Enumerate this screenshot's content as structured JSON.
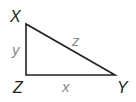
{
  "diagram": {
    "type": "right-triangle",
    "vertices": [
      {
        "label": "X",
        "x": 26,
        "y": 24
      },
      {
        "label": "Z",
        "x": 26,
        "y": 75
      },
      {
        "label": "Y",
        "x": 115,
        "y": 75
      }
    ],
    "sides": [
      {
        "label": "y",
        "between": "X-Z"
      },
      {
        "label": "x",
        "between": "Z-Y"
      },
      {
        "label": "z",
        "between": "X-Y"
      }
    ],
    "colors": {
      "stroke": "#222222",
      "vertex_label": "#222222",
      "side_label": "#8a8a8a"
    }
  }
}
